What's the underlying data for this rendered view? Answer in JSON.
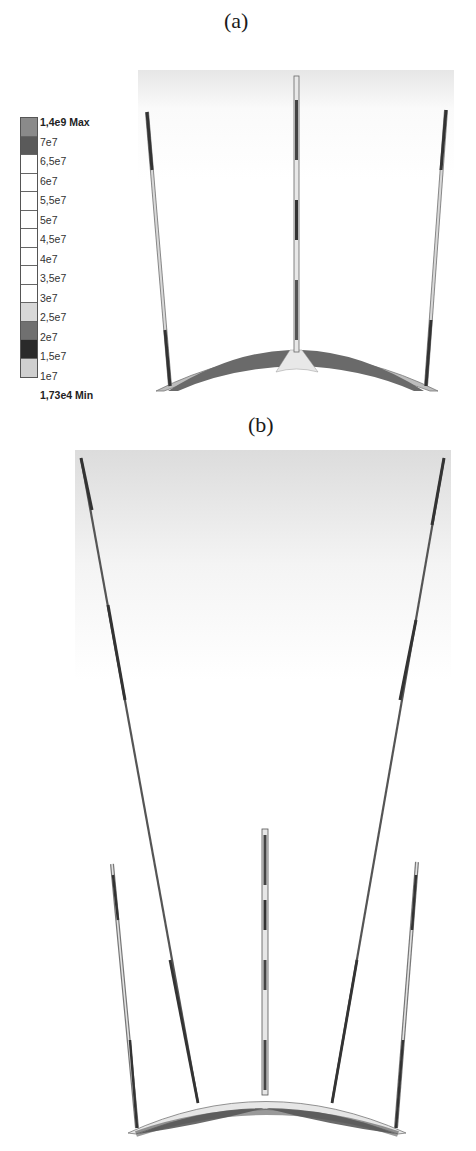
{
  "figure": {
    "panel_a": {
      "label": "(a)"
    },
    "panel_b": {
      "label": "(b)"
    },
    "legend": {
      "entries": [
        {
          "label": "1,4e9 Max",
          "bold": true,
          "color": "#8a8a8a"
        },
        {
          "label": "7e7",
          "bold": false,
          "color": "#5a5a5a"
        },
        {
          "label": "6,5e7",
          "bold": false,
          "color": "#ffffff"
        },
        {
          "label": "6e7",
          "bold": false,
          "color": "#ffffff"
        },
        {
          "label": "5,5e7",
          "bold": false,
          "color": "#ffffff"
        },
        {
          "label": "5e7",
          "bold": false,
          "color": "#ffffff"
        },
        {
          "label": "4,5e7",
          "bold": false,
          "color": "#ffffff"
        },
        {
          "label": "4e7",
          "bold": false,
          "color": "#ffffff"
        },
        {
          "label": "3,5e7",
          "bold": false,
          "color": "#ffffff"
        },
        {
          "label": "3e7",
          "bold": false,
          "color": "#ffffff"
        },
        {
          "label": "2,5e7",
          "bold": false,
          "color": "#d8d8d8"
        },
        {
          "label": "2e7",
          "bold": false,
          "color": "#707070"
        },
        {
          "label": "1,5e7",
          "bold": false,
          "color": "#2a2a2a"
        },
        {
          "label": "1e7",
          "bold": false,
          "color": "#cfcfcf"
        },
        {
          "label": "1,73e4 Min",
          "bold": true,
          "color": null
        }
      ],
      "max_label": "1,4e9 Max",
      "min_label": "1,73e4 Min"
    },
    "colors": {
      "background_top": "#e2e2e2",
      "strut_dark": "#3a3a3a",
      "strut_light": "#c8c8c8",
      "arc_dark": "#6a6a6a",
      "arc_light": "#bdbdbd"
    }
  }
}
